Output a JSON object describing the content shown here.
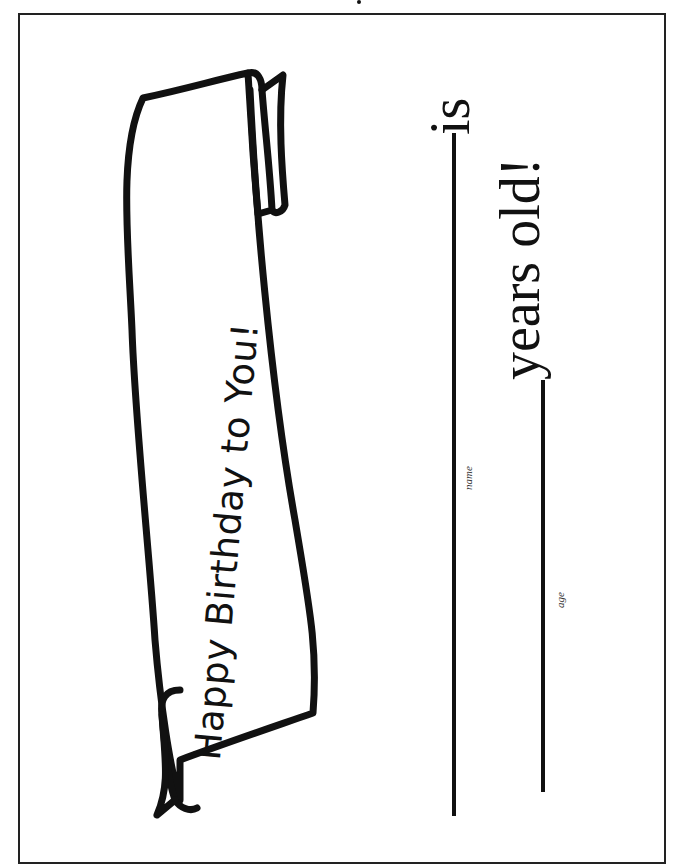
{
  "certificate": {
    "banner_text": "Happy Birthday to You!",
    "statement_is": "is",
    "statement_years": "years old!",
    "fields": [
      {
        "label": "name",
        "value": ""
      },
      {
        "label": "age",
        "value": ""
      }
    ]
  },
  "colors": {
    "ink": "#111111",
    "paper": "#ffffff",
    "border": "#222222"
  }
}
